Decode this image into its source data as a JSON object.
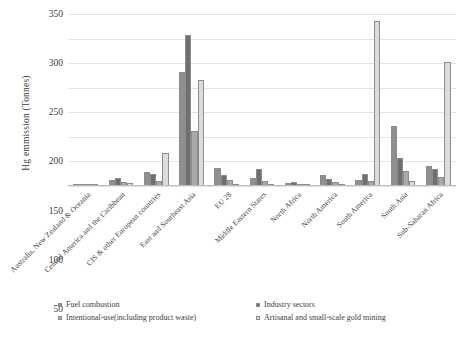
{
  "chart_data": {
    "type": "bar",
    "title": "",
    "xlabel": "",
    "ylabel": "Hg emmission (Tonnes)",
    "ylim": [
      0,
      350
    ],
    "yticks": [
      "0",
      "50",
      "100",
      "150",
      "200",
      "250",
      "300",
      "350"
    ],
    "grid": true,
    "legend_position": "bottom",
    "categories": [
      "Australia, New Zealand & Oceania",
      "Central America and the Caribbean",
      "CIS & other European countries",
      "East and Southeast Asia",
      "EU 28",
      "Middle Eastern States",
      "North Africa",
      "North America",
      "South America",
      "South Asia",
      "Sub-Saharan Africa"
    ],
    "series": [
      {
        "name": "Fuel combustion",
        "color": "#8f8f8f",
        "values": [
          5,
          12,
          29,
          232,
          37,
          16,
          6,
          22,
          13,
          122,
          41
        ]
      },
      {
        "name": "Industry sectors",
        "color": "#6f6f6f",
        "values": [
          4,
          16,
          25,
          307,
          23,
          35,
          9,
          14,
          24,
          58,
          34
        ]
      },
      {
        "name": "Intentional-use(including product waste)",
        "color": "#a9a9a9",
        "values": [
          2,
          9,
          11,
          112,
          13,
          10,
          5,
          8,
          11,
          30,
          18
        ]
      },
      {
        "name": "Artisanal and small-scale gold mining",
        "color": "#dcdcdc",
        "values": [
          1,
          6,
          68,
          216,
          2,
          1,
          2,
          1,
          336,
          10,
          253
        ]
      }
    ]
  },
  "legend": {
    "items": [
      "Fuel combustion",
      "Industry sectors",
      "Intentional-use(including product waste)",
      "Artisanal and small-scale gold mining"
    ]
  }
}
